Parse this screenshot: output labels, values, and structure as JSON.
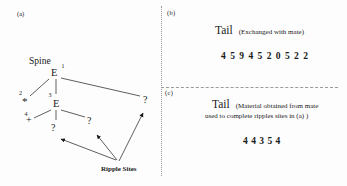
{
  "figure": {
    "panel_a": {
      "label": "(a)",
      "spine_label": "Spine",
      "ripple_sites_label": "Ripple Sites",
      "nodes": {
        "e1": {
          "symbol": "E",
          "superscript": "1"
        },
        "e3": {
          "symbol": "E",
          "superscript": "3"
        },
        "star": {
          "symbol": "*",
          "superscript": "2"
        },
        "plus": {
          "symbol": "+",
          "superscript": "4"
        },
        "question_left": {
          "symbol": "?"
        },
        "question_mid": {
          "symbol": "?"
        },
        "question_right": {
          "symbol": "?"
        }
      }
    },
    "panel_b": {
      "label": "(b)",
      "title": "Tail",
      "subtitle": "(Exchanged with mate)",
      "sequence": [
        4,
        5,
        9,
        4,
        5,
        2,
        0,
        5,
        2,
        2
      ]
    },
    "panel_c": {
      "label": "(c)",
      "title": "Tail",
      "subtitle_line1": "(Material obtained from mate",
      "subtitle_line2": "used to complete ripples sites in (a) )",
      "sequence": [
        4,
        4,
        3,
        5,
        4
      ]
    }
  },
  "colors": {
    "ink": "#1a1a1a",
    "separator": "#999999",
    "background": "#fdfdfd"
  }
}
